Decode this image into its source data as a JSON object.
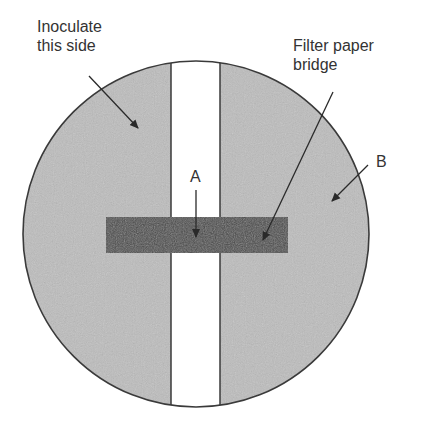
{
  "figure": {
    "type": "petri-dish-diagram",
    "labels": {
      "inoculate": "Inoculate\nthis side",
      "filter_bridge": "Filter paper\nbridge",
      "a": "A",
      "b": "B"
    },
    "colors": {
      "agar": "#bdbdbd",
      "bridge": "#4a4a4a",
      "outline": "#3a3a3a",
      "gap": "#ffffff",
      "text": "#333333"
    }
  }
}
